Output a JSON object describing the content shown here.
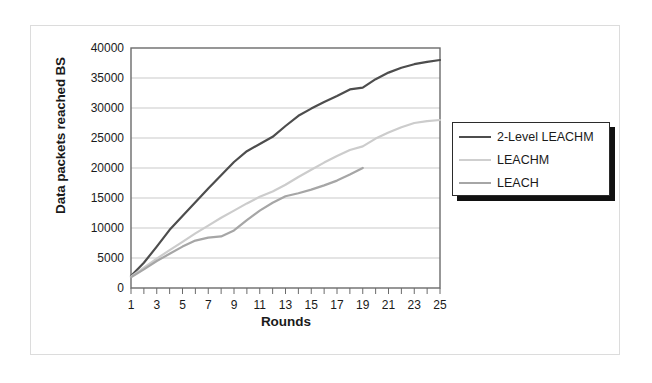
{
  "chart_data": {
    "type": "line",
    "title": "",
    "xlabel": "Rounds",
    "ylabel": "Data packets reached BS",
    "xlim": [
      1,
      25
    ],
    "ylim": [
      0,
      40000
    ],
    "grid": true,
    "legend_position": "right",
    "x_tick_labels": [
      "1",
      "3",
      "5",
      "7",
      "9",
      "11",
      "13",
      "15",
      "17",
      "19",
      "21",
      "23",
      "25"
    ],
    "x_tick_values": [
      1,
      3,
      5,
      7,
      9,
      11,
      13,
      15,
      17,
      19,
      21,
      23,
      25
    ],
    "y_tick_labels": [
      "0",
      "5000",
      "10000",
      "15000",
      "20000",
      "25000",
      "30000",
      "35000",
      "40000"
    ],
    "y_tick_values": [
      0,
      5000,
      10000,
      15000,
      20000,
      25000,
      30000,
      35000,
      40000
    ],
    "x": [
      1,
      2,
      3,
      4,
      5,
      6,
      7,
      8,
      9,
      10,
      11,
      12,
      13,
      14,
      15,
      16,
      17,
      18,
      19,
      20,
      21,
      22,
      23,
      24,
      25
    ],
    "series": [
      {
        "name": "2-Level LEACHM",
        "color": "#4d4d4d",
        "width": 2.2,
        "values": [
          2000,
          4200,
          6900,
          9700,
          12000,
          14300,
          16600,
          18800,
          21000,
          22800,
          24000,
          25200,
          27000,
          28700,
          29900,
          31000,
          32000,
          33100,
          33400,
          34800,
          35900,
          36700,
          37300,
          37700,
          38000
        ]
      },
      {
        "name": "LEACHM",
        "color": "#cccccc",
        "width": 2.2,
        "values": [
          1900,
          3400,
          4900,
          6300,
          7700,
          9100,
          10400,
          11700,
          12900,
          14100,
          15200,
          16100,
          17200,
          18500,
          19700,
          20900,
          22000,
          23000,
          23600,
          24900,
          25900,
          26800,
          27500,
          27800,
          28000
        ]
      },
      {
        "name": "LEACH",
        "color": "#a6a6a6",
        "width": 2.2,
        "values": [
          1800,
          3100,
          4500,
          5700,
          6900,
          7900,
          8400,
          8600,
          9600,
          11300,
          12900,
          14200,
          15300,
          15800,
          16400,
          17100,
          17900,
          18900,
          20000,
          null,
          null,
          null,
          null,
          null,
          null
        ]
      }
    ]
  },
  "legend": {
    "items": [
      {
        "label": "2-Level LEACHM",
        "color": "#4d4d4d"
      },
      {
        "label": "LEACHM",
        "color": "#cfcfcf"
      },
      {
        "label": "LEACH",
        "color": "#a6a6a6"
      }
    ]
  },
  "axes": {
    "x_title": "Rounds",
    "y_title": "Data packets reached BS"
  },
  "colors": {
    "plot_border": "#6b6b6b",
    "gridline": "#c9c9c9",
    "text": "#1a1a1a",
    "outer_frame": "#dcdcdc",
    "legend_border": "#2b2b2b",
    "legend_shadow": "#111111"
  }
}
